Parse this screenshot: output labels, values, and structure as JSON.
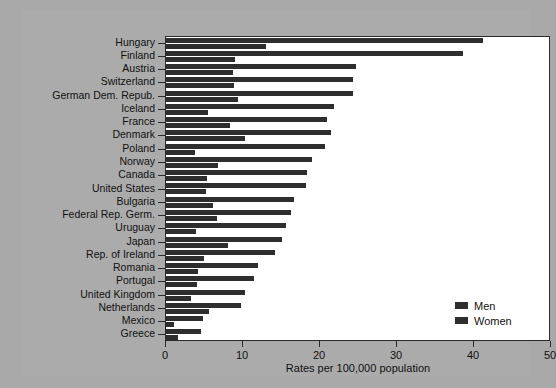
{
  "chart_data": {
    "type": "bar",
    "orientation": "horizontal",
    "title": "",
    "xlabel": "Rates per 100,000 population",
    "ylabel": "",
    "xlim": [
      0,
      50
    ],
    "xticks": [
      0,
      10,
      20,
      30,
      40,
      50
    ],
    "grid": false,
    "legend_position": "inside-bottom-right",
    "categories": [
      "Hungary",
      "Finland",
      "Austria",
      "Switzerland",
      "German Dem. Repub.",
      "Iceland",
      "France",
      "Denmark",
      "Poland",
      "Norway",
      "Canada",
      "United States",
      "Bulgaria",
      "Federal Rep. Germ.",
      "Uruguay",
      "Japan",
      "Rep. of Ireland",
      "Romania",
      "Portugal",
      "United Kingdom",
      "Netherlands",
      "Mexico",
      "Greece"
    ],
    "series": [
      {
        "name": "Men",
        "color": "#2e2e2e",
        "values": [
          41.2,
          38.6,
          24.7,
          24.3,
          24.3,
          21.8,
          20.9,
          21.4,
          20.7,
          19.0,
          18.3,
          18.2,
          16.6,
          16.2,
          15.6,
          15.1,
          14.2,
          12.0,
          11.4,
          10.3,
          9.7,
          4.8,
          4.5
        ]
      },
      {
        "name": "Women",
        "color": "#2e2e2e",
        "values": [
          13.0,
          9.0,
          8.7,
          8.8,
          9.3,
          5.5,
          8.3,
          10.3,
          3.8,
          6.7,
          5.3,
          5.2,
          6.1,
          6.6,
          3.9,
          8.1,
          4.9,
          4.1,
          4.0,
          3.2,
          5.6,
          1.0,
          1.6
        ]
      }
    ]
  },
  "legend": {
    "entries": [
      {
        "label": "Men"
      },
      {
        "label": "Women"
      }
    ]
  },
  "axis": {
    "x_title": "Rates per 100,000 population",
    "x_tick_labels": [
      "0",
      "10",
      "20",
      "30",
      "40",
      "50"
    ]
  }
}
